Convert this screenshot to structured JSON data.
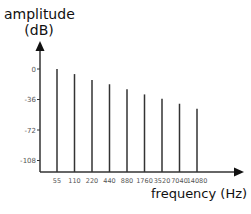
{
  "chart_data": {
    "type": "bar",
    "title": "",
    "xlabel": "frequency (Hz)",
    "ylabel_line1": "amplitude",
    "ylabel_line2": "(dB)",
    "categories": [
      "55",
      "110",
      "220",
      "440",
      "880",
      "1760",
      "3520",
      "7040",
      "14080"
    ],
    "values": [
      0,
      -6,
      -13,
      -18,
      -24,
      -30,
      -35,
      -41,
      -47
    ],
    "yticks": [
      "0",
      "-36",
      "-72",
      "-108"
    ],
    "ytick_values": [
      0,
      -36,
      -72,
      -108
    ],
    "ylim": [
      -122,
      30
    ],
    "grid": false,
    "legend": null,
    "bar_color": "#333333",
    "axis_color": "#333333"
  }
}
